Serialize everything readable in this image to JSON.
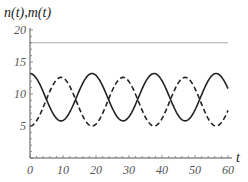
{
  "chart_data": {
    "type": "line",
    "title": "",
    "ylabel": "n(t),m(t)",
    "xlabel": "t",
    "xlim": [
      0,
      60
    ],
    "ylim": [
      0,
      20
    ],
    "xticks": [
      0,
      10,
      20,
      30,
      40,
      50,
      60
    ],
    "yticks": [
      5,
      10,
      15,
      20
    ],
    "grid": false,
    "legend": null,
    "series": [
      {
        "name": "n(t)",
        "style": "solid",
        "color": "#222222",
        "model": "9.5 + 3.7*cos(2*pi*t/18.8)",
        "x": [
          0,
          4.7,
          9.4,
          14.1,
          18.8,
          23.5,
          28.2,
          32.9,
          37.6,
          42.3,
          47.0,
          51.7,
          56.4,
          60
        ],
        "values": [
          13.2,
          9.5,
          5.8,
          9.5,
          13.2,
          9.5,
          5.8,
          9.5,
          13.2,
          9.5,
          5.8,
          9.5,
          13.2,
          10.6
        ]
      },
      {
        "name": "m(t)",
        "style": "dashed",
        "color": "#222222",
        "model": "8.8 - 3.8*cos(2*pi*t/18.8)",
        "x": [
          0,
          4.7,
          9.4,
          14.1,
          18.8,
          23.5,
          28.2,
          32.9,
          37.6,
          42.3,
          47.0,
          51.7,
          56.4,
          60
        ],
        "values": [
          5.0,
          8.8,
          12.6,
          8.8,
          5.0,
          8.8,
          12.6,
          8.8,
          5.0,
          8.8,
          12.6,
          8.8,
          5.0,
          7.9
        ]
      },
      {
        "name": "reference level",
        "style": "solid-thin",
        "color": "#aaaaaa",
        "x": [
          0,
          60
        ],
        "values": [
          18,
          18
        ]
      }
    ]
  },
  "axes": {
    "y_title": "n(t),m(t)",
    "x_title": "t",
    "x_tick_labels": [
      "0",
      "10",
      "20",
      "30",
      "40",
      "50",
      "60"
    ],
    "y_tick_labels": [
      "5",
      "10",
      "15",
      "20"
    ]
  }
}
